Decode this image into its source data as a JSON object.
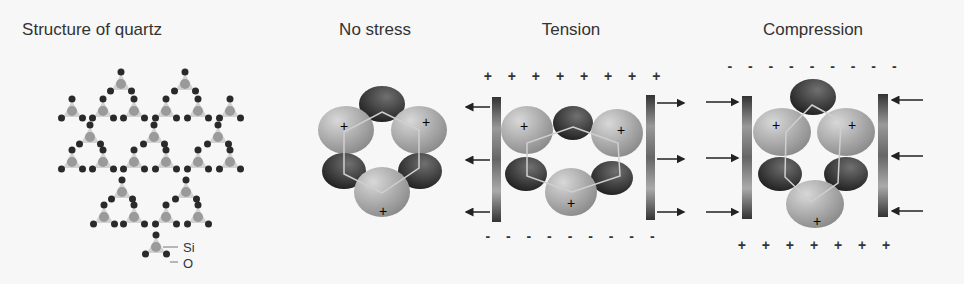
{
  "panels": [
    {
      "id": "quartz",
      "title": "Structure of quartz",
      "labels": {
        "si": "Si",
        "o": "O"
      }
    },
    {
      "id": "no-stress",
      "title": "No stress"
    },
    {
      "id": "tension",
      "title": "Tension",
      "top_charge": "+ + + + + + + +",
      "bottom_charge": "- - - - - - - - -"
    },
    {
      "id": "compression",
      "title": "Compression",
      "top_charge": "- - - - - - - - -",
      "bottom_charge": "+ + + + + + +"
    }
  ],
  "colors": {
    "background": "#f7f7f7",
    "oxygen": "#2a2a2a",
    "silicon": "#9a9a9a",
    "tetra": "#c8c8c8",
    "text": "#333333"
  }
}
